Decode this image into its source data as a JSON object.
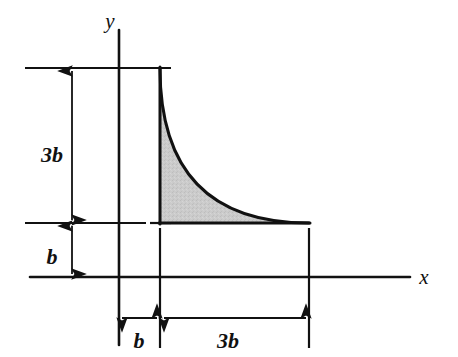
{
  "figure": {
    "background_color": "#ffffff",
    "line_color": "#111111",
    "fill_color": "#c9c9c9",
    "axes": {
      "x_label": "x",
      "y_label": "y",
      "x_axis": {
        "y": 277,
        "x_start": 30,
        "x_end": 410
      },
      "y_axis": {
        "x": 119,
        "y_start": 30,
        "y_end": 345
      },
      "origin": {
        "x": 119,
        "y": 277
      }
    },
    "shape": {
      "type": "spandrel",
      "curve": "quadratic",
      "left_x": 160,
      "right_x": 309,
      "top_y": 68,
      "base_y": 223,
      "description": "Curve starts at upper-left corner and decays to be tangent with the horizontal base at the lower-right corner"
    },
    "dimensions": [
      {
        "name": "vertical-height",
        "label": "3b",
        "orientation": "vertical",
        "value_expression": "3b",
        "from_y": 68,
        "to_y": 223,
        "at_x": 72,
        "label_x": 52,
        "label_y": 155
      },
      {
        "name": "vertical-offset",
        "label": "b",
        "orientation": "vertical",
        "value_expression": "b",
        "from_y": 223,
        "to_y": 277,
        "at_x": 72,
        "label_x": 52,
        "label_y": 258
      },
      {
        "name": "horizontal-offset",
        "label": "b",
        "orientation": "horizontal",
        "value_expression": "b",
        "from_x": 119,
        "to_x": 160,
        "at_y": 318,
        "label_x": 134,
        "label_y": 344
      },
      {
        "name": "horizontal-width",
        "label": "3b",
        "orientation": "horizontal",
        "value_expression": "3b",
        "from_x": 160,
        "to_x": 309,
        "at_y": 318,
        "label_x": 222,
        "label_y": 344
      }
    ]
  }
}
